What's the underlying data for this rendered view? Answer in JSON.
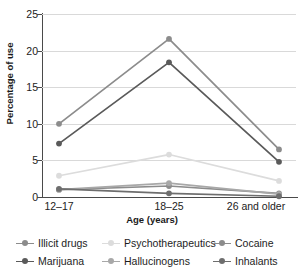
{
  "chart_data": {
    "type": "line",
    "title": "",
    "xlabel": "Age (years)",
    "ylabel": "Percentage of use",
    "categories": [
      "12–17",
      "18–25",
      "26 and older"
    ],
    "ylim": [
      0,
      25
    ],
    "yticks": [
      0,
      5,
      10,
      15,
      20,
      25
    ],
    "grid": true,
    "legend_position": "bottom",
    "series": [
      {
        "name": "Illicit drugs",
        "values": [
          10.0,
          21.6,
          6.5
        ],
        "color": "#8c8c8c"
      },
      {
        "name": "Psychotherapeutics",
        "values": [
          2.9,
          5.8,
          2.2
        ],
        "color": "#dcdcdc"
      },
      {
        "name": "Cocaine",
        "values": [
          1.0,
          1.5,
          0.5
        ],
        "color": "#8c8c8c"
      },
      {
        "name": "Marijuana",
        "values": [
          7.3,
          18.4,
          4.8
        ],
        "color": "#5a5a5a"
      },
      {
        "name": "Hallucinogens",
        "values": [
          1.0,
          1.9,
          0.4
        ],
        "color": "#a8a8a8"
      },
      {
        "name": "Inhalants",
        "values": [
          1.1,
          0.5,
          0.1
        ],
        "color": "#6e6e6e"
      }
    ]
  },
  "axis": {
    "y_title": "Percentage of use",
    "x_title": "Age (years)",
    "y_ticks": [
      "0",
      "5",
      "10",
      "15",
      "20",
      "25"
    ],
    "x_ticks": [
      "12–17",
      "18–25",
      "26 and older"
    ]
  },
  "legend": {
    "items": [
      {
        "label": "Illicit drugs"
      },
      {
        "label": "Psychotherapeutics"
      },
      {
        "label": "Cocaine"
      },
      {
        "label": "Marijuana"
      },
      {
        "label": "Hallucinogens"
      },
      {
        "label": "Inhalants"
      }
    ]
  }
}
